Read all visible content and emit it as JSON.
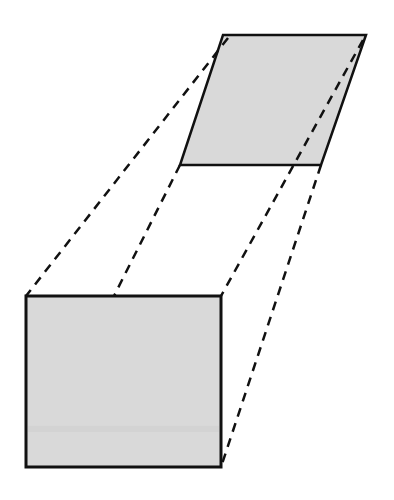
{
  "diagram": {
    "width": 394,
    "height": 500,
    "colors": {
      "background": "#ffffff",
      "fill": "#d9d9d9",
      "stroke": "#111111",
      "band": "#cfcfcf"
    },
    "parallelogram": {
      "points": [
        [
          223,
          35
        ],
        [
          366,
          35
        ],
        [
          321,
          165
        ],
        [
          180,
          165
        ]
      ]
    },
    "rectangle": {
      "x": 26,
      "y": 296,
      "width": 195,
      "height": 171
    },
    "connectors": [
      {
        "from": [
          228,
          38
        ],
        "to": [
          26,
          296
        ]
      },
      {
        "from": [
          180,
          165
        ],
        "to": [
          114,
          296
        ]
      },
      {
        "from": [
          363,
          40
        ],
        "to": [
          221,
          296
        ]
      },
      {
        "from": [
          321,
          165
        ],
        "to": [
          221,
          467
        ]
      }
    ]
  }
}
